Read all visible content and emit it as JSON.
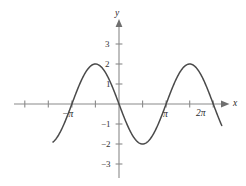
{
  "chart_data": {
    "type": "line",
    "title": "",
    "subtitle": "",
    "xlabel": "x",
    "ylabel": "y",
    "function": "y = -2 sin(x)",
    "amplitude": 2,
    "period": "2π",
    "xlim": [
      -4.4,
      7.6
    ],
    "ylim": [
      -3.7,
      3.6
    ],
    "grid": false,
    "legend": null,
    "x_tick_values": [
      -4.712,
      -3.142,
      -1.571,
      0,
      1.571,
      3.142,
      4.712,
      6.283
    ],
    "x_tick_labels": [
      "",
      "−π",
      "",
      "",
      "",
      "π",
      "",
      "2π"
    ],
    "y_tick_values": [
      3,
      2,
      1,
      -1,
      -2,
      -3
    ],
    "y_tick_labels": [
      "3",
      "2",
      "1",
      "−1",
      "−2",
      "−3"
    ],
    "key_points": [
      {
        "x": -3.142,
        "y": 0,
        "note": "zero crossing at -π"
      },
      {
        "x": -1.571,
        "y": 2,
        "note": "maximum"
      },
      {
        "x": 0,
        "y": 0,
        "note": "origin crossing"
      },
      {
        "x": 1.571,
        "y": -2,
        "note": "minimum"
      },
      {
        "x": 3.142,
        "y": 0,
        "note": "zero crossing at π"
      },
      {
        "x": 6.283,
        "y": 0,
        "note": "zero crossing at 2π"
      }
    ],
    "series": [
      {
        "name": "y = -2 sin(x)",
        "color": "#4a4a4a",
        "values": []
      }
    ]
  },
  "figure": {
    "axis_x_name": "x",
    "axis_y_name": "y",
    "x_labels": [
      {
        "id": "neg-pi",
        "text": "−π"
      },
      {
        "id": "pi",
        "text": "π"
      },
      {
        "id": "two-pi",
        "text": "2π"
      }
    ],
    "y_labels": [
      {
        "id": "y3",
        "text": "3"
      },
      {
        "id": "y2",
        "text": "2"
      },
      {
        "id": "y1",
        "text": "1"
      },
      {
        "id": "ym1",
        "text": "−1"
      },
      {
        "id": "ym2",
        "text": "−2"
      },
      {
        "id": "ym3",
        "text": "−3"
      }
    ],
    "colors": {
      "background": "#ffffff",
      "axis": "#8a8a8a",
      "curve": "#4a4a4a",
      "text": "#2b2b2b"
    }
  }
}
